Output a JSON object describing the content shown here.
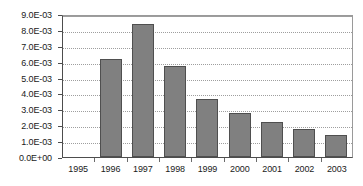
{
  "chart_data": {
    "type": "bar",
    "title": "",
    "xlabel": "",
    "ylabel": "",
    "categories": [
      "1995",
      "1996",
      "1997",
      "1998",
      "1999",
      "2000",
      "2001",
      "2002",
      "2003"
    ],
    "values": [
      0,
      0.0062,
      0.0084,
      0.0057,
      0.00365,
      0.0028,
      0.0022,
      0.00175,
      0.0014
    ],
    "ylim": [
      0,
      0.009
    ],
    "ytick_values": [
      0,
      0.001,
      0.002,
      0.003,
      0.004,
      0.005,
      0.006,
      0.007,
      0.008,
      0.009
    ],
    "ytick_labels": [
      "0.0E+00",
      "1.0E-03",
      "2.0E-03",
      "3.0E-03",
      "4.0E-03",
      "5.0E-03",
      "6.0E-03",
      "7.0E-03",
      "8.0E-03",
      "9.0E-03"
    ],
    "grid": true,
    "grid_axis": "y",
    "legend": false,
    "legend_position": "none",
    "series": [
      {
        "name": "series-1",
        "values": [
          0,
          0.0062,
          0.0084,
          0.0057,
          0.00365,
          0.0028,
          0.0022,
          0.00175,
          0.0014
        ]
      }
    ],
    "colors": {
      "bar_fill": "#808080",
      "bar_border": "#4f4f4f",
      "grid": "#9e9e9e",
      "axis": "#4d4d4d",
      "plot_frame": "#9a9a9a",
      "background": "#ffffff",
      "text": "#1a1a1a"
    }
  }
}
